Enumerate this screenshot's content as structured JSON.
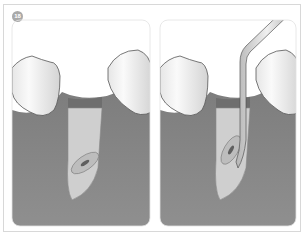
{
  "figure": {
    "step_badge": "18",
    "panels": [
      {
        "name": "before-instrument",
        "description": "Empty extraction socket between two teeth with root tip in bone"
      },
      {
        "name": "with-instrument",
        "description": "Elevator instrument inserted into socket beside root tip"
      }
    ],
    "colors": {
      "gum": "#8a8a8a",
      "gum_dark": "#6f6f6f",
      "tooth": "#f2f2f2",
      "root": "#c9c9c9",
      "badge": "#a9a9a9",
      "border": "#d8d8d8"
    }
  }
}
